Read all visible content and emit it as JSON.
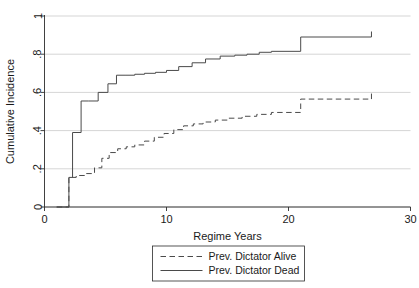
{
  "chart_data": {
    "type": "line",
    "title": "",
    "xlabel": "Regime Years",
    "ylabel": "Cumulative Incidence",
    "xlim": [
      0,
      30
    ],
    "ylim": [
      0,
      1
    ],
    "xticks": [
      0,
      10,
      20,
      30
    ],
    "xtick_labels": [
      "0",
      "10",
      "20",
      "30"
    ],
    "yticks": [
      0,
      0.2,
      0.4,
      0.6,
      0.8,
      1
    ],
    "ytick_labels": [
      "0",
      ".2",
      ".4",
      ".6",
      ".8",
      "1"
    ],
    "grid": "horizontal",
    "legend_position": "below-center",
    "step_shape": "post",
    "line_color": "#4a4a4a",
    "grid_color": "#b8b8b8",
    "axis_color": "#2b2b2b",
    "series": [
      {
        "name": "Prev. Dictator Alive",
        "style": "dashed",
        "x": [
          1,
          2,
          2.6,
          3.3,
          4.1,
          4.7,
          5.3,
          6.0,
          6.7,
          7.4,
          8.2,
          9.0,
          9.8,
          10.6,
          11.4,
          12.2,
          13.0,
          14.0,
          15.0,
          16.2,
          17.4,
          18.6,
          21.0,
          26.8
        ],
        "values": [
          0,
          0.155,
          0.165,
          0.175,
          0.205,
          0.255,
          0.285,
          0.305,
          0.315,
          0.325,
          0.345,
          0.365,
          0.385,
          0.405,
          0.425,
          0.435,
          0.445,
          0.455,
          0.465,
          0.475,
          0.485,
          0.495,
          0.565,
          0.565
        ],
        "censor_marks": [
          26.8
        ]
      },
      {
        "name": "Prev. Dictator Dead",
        "style": "solid",
        "x": [
          1,
          2,
          2.3,
          3.0,
          3.6,
          4.4,
          5.2,
          5.9,
          6.6,
          7.4,
          8.2,
          9.1,
          10.0,
          11.0,
          12.1,
          13.2,
          14.4,
          15.6,
          16.6,
          17.6,
          18.6,
          21.0,
          26.8
        ],
        "values": [
          0,
          0.155,
          0.39,
          0.555,
          0.555,
          0.6,
          0.645,
          0.69,
          0.69,
          0.695,
          0.7,
          0.705,
          0.715,
          0.735,
          0.755,
          0.775,
          0.79,
          0.795,
          0.8,
          0.81,
          0.815,
          0.89,
          0.89
        ],
        "censor_marks": [
          26.8
        ]
      }
    ],
    "legend_entries": [
      {
        "label": "Prev. Dictator Alive",
        "style": "dashed"
      },
      {
        "label": "Prev. Dictator Dead",
        "style": "solid"
      }
    ]
  }
}
